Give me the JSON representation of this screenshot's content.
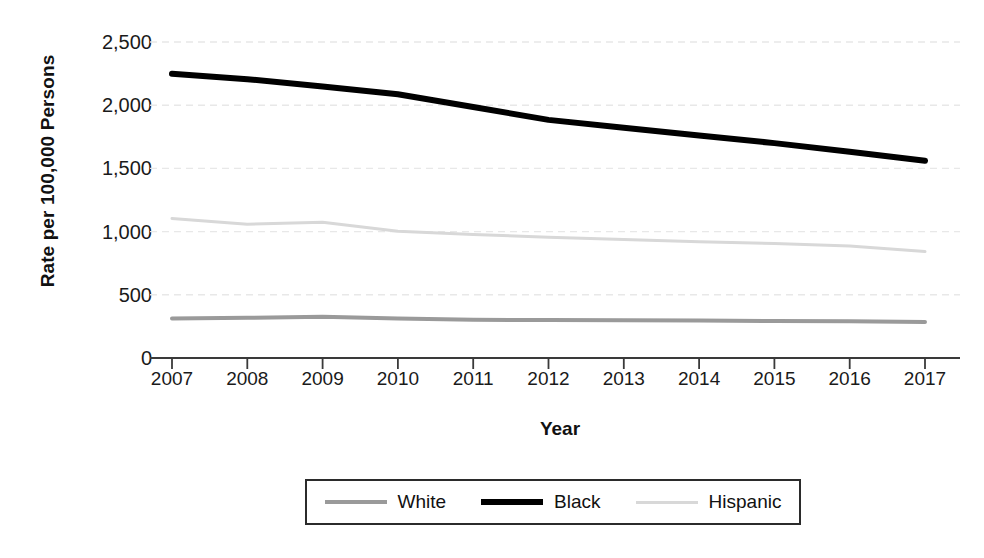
{
  "chart_data": {
    "type": "line",
    "title": "",
    "xlabel": "Year",
    "ylabel": "Rate per 100,000 Persons",
    "x": [
      2007,
      2008,
      2009,
      2010,
      2011,
      2012,
      2013,
      2014,
      2015,
      2016,
      2017
    ],
    "xtick_labels": [
      "2007",
      "2008",
      "2009",
      "2010",
      "2011",
      "2012",
      "2013",
      "2014",
      "2015",
      "2016",
      "2017"
    ],
    "ytick_labels": [
      "0",
      "500",
      "1,000",
      "1,500",
      "2,000",
      "2,500"
    ],
    "ytick_values": [
      0,
      500,
      1000,
      1500,
      2000,
      2500
    ],
    "ylim": [
      0,
      2650
    ],
    "xlim": [
      2006.75,
      2017.45
    ],
    "grid": true,
    "grid_axis": "y",
    "legend_position": "bottom-center",
    "series": [
      {
        "name": "White",
        "color": "#9a9a9a",
        "line_width": 4,
        "values": [
          312,
          318,
          326,
          312,
          302,
          300,
          298,
          296,
          292,
          290,
          284
        ]
      },
      {
        "name": "Black",
        "color": "#000000",
        "line_width": 6,
        "values": [
          2248,
          2206,
          2148,
          2086,
          1986,
          1884,
          1822,
          1760,
          1700,
          1632,
          1560
        ]
      },
      {
        "name": "Hispanic",
        "color": "#d8d8d8",
        "line_width": 3,
        "values": [
          1104,
          1058,
          1074,
          1002,
          978,
          956,
          938,
          920,
          906,
          886,
          842
        ]
      }
    ]
  },
  "legend": {
    "entries": [
      {
        "label": "White",
        "swatch": "line-swatch-white"
      },
      {
        "label": "Black",
        "swatch": "line-swatch-black"
      },
      {
        "label": "Hispanic",
        "swatch": "line-swatch-hispanic"
      }
    ]
  },
  "colors": {
    "white_series": "#9a9a9a",
    "black_series": "#000000",
    "hispanic_series": "#d8d8d8",
    "axis": "#3a3a3a",
    "grid": "#e8e8e8",
    "text": "#1a1a1a",
    "background": "#ffffff"
  }
}
